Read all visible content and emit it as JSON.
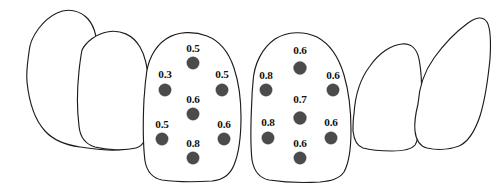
{
  "diagram": {
    "background_color": "#ffffff",
    "outline_color": "#1c1c1c",
    "dot_color": "#4b4b4b",
    "label_color": "#111111"
  },
  "teeth": [
    {
      "id": "left-canine",
      "name": "left-canine",
      "has_measurements": false
    },
    {
      "id": "left-lateral-incisor",
      "name": "left-lateral-incisor",
      "has_measurements": false
    },
    {
      "id": "left-central-incisor",
      "name": "left-central-incisor",
      "has_measurements": true
    },
    {
      "id": "right-central-incisor",
      "name": "right-central-incisor",
      "has_measurements": true
    },
    {
      "id": "right-lateral-incisor",
      "name": "right-lateral-incisor",
      "has_measurements": false
    },
    {
      "id": "right-canine",
      "name": "right-canine",
      "has_measurements": false
    }
  ],
  "left_central_incisor": {
    "tooth_name": "left-central-incisor",
    "points": [
      {
        "position": "top-center",
        "value": "0.5",
        "dot_x": 193,
        "dot_y": 63,
        "label_x": 193,
        "label_y": 52
      },
      {
        "position": "mid-left",
        "value": "0.3",
        "dot_x": 165,
        "dot_y": 90,
        "label_x": 165,
        "label_y": 78
      },
      {
        "position": "mid-right",
        "value": "0.5",
        "dot_x": 222,
        "dot_y": 90,
        "label_x": 222,
        "label_y": 78
      },
      {
        "position": "center",
        "value": "0.6",
        "dot_x": 193,
        "dot_y": 114,
        "label_x": 193,
        "label_y": 103
      },
      {
        "position": "lower-left",
        "value": "0.5",
        "dot_x": 162,
        "dot_y": 139,
        "label_x": 162,
        "label_y": 128
      },
      {
        "position": "lower-right",
        "value": "0.6",
        "dot_x": 224,
        "dot_y": 139,
        "label_x": 224,
        "label_y": 128
      },
      {
        "position": "bottom-center",
        "value": "0.8",
        "dot_x": 193,
        "dot_y": 158,
        "label_x": 193,
        "label_y": 147
      }
    ]
  },
  "right_central_incisor": {
    "tooth_name": "right-central-incisor",
    "points": [
      {
        "position": "top-center",
        "value": "0.6",
        "dot_x": 300,
        "dot_y": 68,
        "label_x": 300,
        "label_y": 54
      },
      {
        "position": "mid-left",
        "value": "0.8",
        "dot_x": 266,
        "dot_y": 90,
        "label_x": 266,
        "label_y": 79
      },
      {
        "position": "mid-right",
        "value": "0.6",
        "dot_x": 333,
        "dot_y": 90,
        "label_x": 333,
        "label_y": 79
      },
      {
        "position": "center",
        "value": "0.7",
        "dot_x": 300,
        "dot_y": 118,
        "label_x": 300,
        "label_y": 103
      },
      {
        "position": "lower-left",
        "value": "0.8",
        "dot_x": 268,
        "dot_y": 138,
        "label_x": 268,
        "label_y": 126
      },
      {
        "position": "lower-right",
        "value": "0.6",
        "dot_x": 331,
        "dot_y": 138,
        "label_x": 331,
        "label_y": 126
      },
      {
        "position": "bottom-center",
        "value": "0.6",
        "dot_x": 300,
        "dot_y": 158,
        "label_x": 300,
        "label_y": 147
      }
    ]
  },
  "chart_data": {
    "type": "scatter",
    "xlabel": "",
    "ylabel": "",
    "grid": false,
    "legend": null,
    "series": [
      {
        "name": "left-central-incisor",
        "points": [
          {
            "position": "top-center",
            "x": 193,
            "y": 63,
            "value": 0.5
          },
          {
            "position": "mid-left",
            "x": 165,
            "y": 90,
            "value": 0.3
          },
          {
            "position": "mid-right",
            "x": 222,
            "y": 90,
            "value": 0.5
          },
          {
            "position": "center",
            "x": 193,
            "y": 114,
            "value": 0.6
          },
          {
            "position": "lower-left",
            "x": 162,
            "y": 139,
            "value": 0.5
          },
          {
            "position": "lower-right",
            "x": 224,
            "y": 139,
            "value": 0.6
          },
          {
            "position": "bottom-center",
            "x": 193,
            "y": 158,
            "value": 0.8
          }
        ]
      },
      {
        "name": "right-central-incisor",
        "points": [
          {
            "position": "top-center",
            "x": 300,
            "y": 68,
            "value": 0.6
          },
          {
            "position": "mid-left",
            "x": 266,
            "y": 90,
            "value": 0.8
          },
          {
            "position": "mid-right",
            "x": 333,
            "y": 90,
            "value": 0.6
          },
          {
            "position": "center",
            "x": 300,
            "y": 118,
            "value": 0.7
          },
          {
            "position": "lower-left",
            "x": 268,
            "y": 138,
            "value": 0.8
          },
          {
            "position": "lower-right",
            "x": 331,
            "y": 138,
            "value": 0.6
          },
          {
            "position": "bottom-center",
            "x": 300,
            "y": 158,
            "value": 0.6
          }
        ]
      }
    ]
  }
}
